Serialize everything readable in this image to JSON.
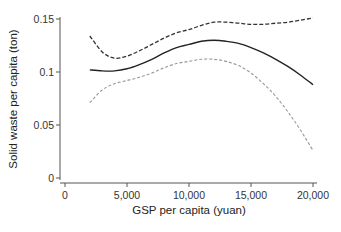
{
  "chart_data": {
    "type": "line",
    "title": "",
    "xlabel": "GSP per capita (yuan)",
    "ylabel": "Solid waste per capita (ton)",
    "xlim": [
      0,
      20000
    ],
    "ylim": [
      0,
      0.15
    ],
    "x_ticks": [
      0,
      5000,
      10000,
      15000,
      20000
    ],
    "x_tick_labels": [
      "0",
      "5,000",
      "10,000",
      "15,000",
      "20,000"
    ],
    "y_ticks": [
      0,
      0.05,
      0.1,
      0.15
    ],
    "y_tick_labels": [
      "0",
      "0.05",
      "0.1",
      "0.15"
    ],
    "grid": false,
    "legend": null,
    "x": [
      2000,
      3000,
      4000,
      5000,
      6000,
      7000,
      8000,
      9000,
      10000,
      11000,
      12000,
      13000,
      14000,
      15000,
      16000,
      17000,
      18000,
      19000,
      20000
    ],
    "series": [
      {
        "name": "Upper confidence bound",
        "style": "dashed-dark",
        "values": [
          0.134,
          0.119,
          0.113,
          0.115,
          0.12,
          0.126,
          0.132,
          0.137,
          0.14,
          0.144,
          0.147,
          0.147,
          0.146,
          0.145,
          0.145,
          0.146,
          0.147,
          0.149,
          0.151
        ]
      },
      {
        "name": "Fitted",
        "style": "solid",
        "values": [
          0.102,
          0.101,
          0.101,
          0.103,
          0.107,
          0.112,
          0.118,
          0.123,
          0.126,
          0.129,
          0.13,
          0.129,
          0.127,
          0.123,
          0.118,
          0.112,
          0.105,
          0.097,
          0.088
        ]
      },
      {
        "name": "Lower confidence bound",
        "style": "dashed-light",
        "values": [
          0.071,
          0.083,
          0.089,
          0.092,
          0.095,
          0.099,
          0.104,
          0.108,
          0.11,
          0.112,
          0.112,
          0.11,
          0.106,
          0.099,
          0.089,
          0.077,
          0.062,
          0.045,
          0.026
        ]
      }
    ]
  }
}
